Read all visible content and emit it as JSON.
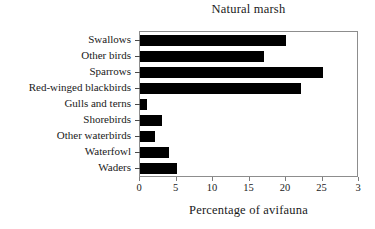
{
  "chart_data": {
    "type": "bar",
    "orientation": "horizontal",
    "title": "Natural marsh",
    "xlabel": "Percentage of avifauna",
    "ylabel": "",
    "xlim": [
      0,
      30
    ],
    "grid": false,
    "legend": null,
    "bar_color": "#000000",
    "frame_color": "#8d8d8d",
    "xticks": [
      0,
      5,
      10,
      15,
      20,
      25,
      30
    ],
    "xticklabels": [
      "0",
      "5",
      "10",
      "15",
      "20",
      "25",
      "3"
    ],
    "note_rightmost_label_clipped": "The 30 tick label is clipped by the image edge and renders as '3'",
    "categories": [
      "Swallows",
      "Other birds",
      "Sparrows",
      "Red-winged blackbirds",
      "Gulls and terns",
      "Shorebirds",
      "Other waterbirds",
      "Waterfowl",
      "Waders"
    ],
    "values": [
      20,
      17,
      25,
      22,
      1,
      3,
      2,
      4,
      5
    ],
    "series": [
      {
        "name": "Percentage of avifauna",
        "values": [
          20,
          17,
          25,
          22,
          1,
          3,
          2,
          4,
          5
        ]
      }
    ]
  }
}
